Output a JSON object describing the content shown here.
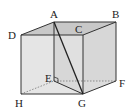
{
  "diagram": {
    "type": "cube",
    "colors": {
      "background": "#ffffff",
      "face_fill": "#dcdcdc",
      "top_fill": "#c8c8c8",
      "edge": "#333333",
      "hidden_edge": "#777777",
      "diagonal": "#222222"
    },
    "vertices": {
      "A": {
        "label": "A",
        "x": 54,
        "y": 22,
        "lx": 50,
        "ly": 18
      },
      "B": {
        "label": "B",
        "x": 116,
        "y": 22,
        "lx": 112,
        "ly": 18
      },
      "C": {
        "label": "C",
        "x": 83,
        "y": 35,
        "lx": 75,
        "ly": 33
      },
      "D": {
        "label": "D",
        "x": 21,
        "y": 35,
        "lx": 8,
        "ly": 39
      },
      "E": {
        "label": "E",
        "x": 54,
        "y": 81,
        "lx": 45,
        "ly": 82
      },
      "F": {
        "label": "F",
        "x": 116,
        "y": 81,
        "lx": 119,
        "ly": 87
      },
      "G": {
        "label": "G",
        "x": 83,
        "y": 94,
        "lx": 78,
        "ly": 107
      },
      "H": {
        "label": "H",
        "x": 21,
        "y": 94,
        "lx": 15,
        "ly": 107
      }
    },
    "visible_edges": [
      "AB",
      "BC",
      "CD",
      "DA",
      "DH",
      "HG",
      "GF",
      "FB",
      "CG",
      "AE",
      "EG"
    ],
    "hidden_edges": [
      "HE",
      "EF"
    ],
    "diagonals": [
      "AG"
    ],
    "right_angle_at": "E"
  }
}
